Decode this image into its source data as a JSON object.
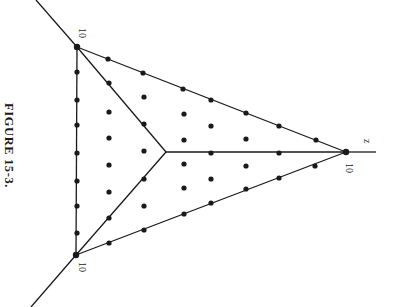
{
  "caption": "FIGURE 15-3.",
  "labels": {
    "top_left_vertex": "10",
    "bottom_left_vertex": "10",
    "right_vertex": "10",
    "right_axis": "z"
  },
  "colors": {
    "ink": "#1a1a1a",
    "background": "#ffffff"
  },
  "geometry": {
    "vertices": {
      "top_left": [
        77,
        47
      ],
      "bottom_left": [
        76,
        255
      ],
      "right": [
        346,
        152
      ],
      "center": [
        166,
        152
      ]
    },
    "axis_extensions": [
      {
        "from": [
          77,
          47
        ],
        "to": [
          36,
          0
        ]
      },
      {
        "from": [
          76,
          255
        ],
        "to": [
          31,
          307
        ]
      },
      {
        "from": [
          346,
          152
        ],
        "to": [
          376,
          152
        ]
      }
    ],
    "edge_dots": [
      [
        77,
        72
      ],
      [
        77,
        100
      ],
      [
        77,
        125
      ],
      [
        77,
        153
      ],
      [
        77,
        181
      ],
      [
        77,
        206
      ],
      [
        77,
        233
      ],
      [
        108,
        59
      ],
      [
        143,
        73
      ],
      [
        183,
        89
      ],
      [
        211,
        100
      ],
      [
        246,
        113
      ],
      [
        279,
        126
      ],
      [
        316,
        140
      ],
      [
        109,
        243
      ],
      [
        144,
        230
      ],
      [
        184,
        214
      ],
      [
        211,
        203
      ],
      [
        246,
        189
      ],
      [
        279,
        178
      ],
      [
        315,
        166
      ]
    ],
    "branch_dots": [
      [
        109,
        83
      ],
      [
        144,
        124
      ],
      [
        109,
        218
      ],
      [
        144,
        179
      ],
      [
        211,
        153
      ],
      [
        279,
        153
      ]
    ],
    "interior_dots": [
      [
        109,
        112
      ],
      [
        109,
        138
      ],
      [
        109,
        165
      ],
      [
        109,
        192
      ],
      [
        144,
        97
      ],
      [
        144,
        151
      ],
      [
        144,
        206
      ],
      [
        184,
        114
      ],
      [
        184,
        140
      ],
      [
        184,
        164
      ],
      [
        184,
        188
      ],
      [
        211,
        126
      ],
      [
        211,
        179
      ],
      [
        246,
        139
      ],
      [
        246,
        166
      ]
    ],
    "vertex_dots": [
      [
        77,
        47
      ],
      [
        76,
        255
      ],
      [
        346,
        152
      ]
    ]
  }
}
